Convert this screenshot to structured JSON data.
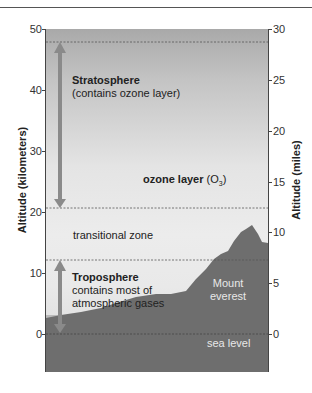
{
  "diagram": {
    "left_axis": {
      "label": "Altitude (kilometers)",
      "ticks": [
        "50",
        "40",
        "30",
        "20",
        "10",
        "0"
      ]
    },
    "right_axis": {
      "label": "Altitude (miles)",
      "ticks": [
        "30",
        "25",
        "20",
        "15",
        "10",
        "5",
        "0"
      ]
    },
    "layers": [
      {
        "name": "Stratosphere",
        "description": "(contains ozone layer)"
      },
      {
        "name": "Troposphere",
        "description_line1": "contains most of",
        "description_line2": "atmospheric gases"
      }
    ],
    "labels": {
      "ozone": "ozone layer",
      "ozone_formula_main": "(O",
      "ozone_formula_sub": "3",
      "ozone_formula_close": ")",
      "transitional": "transitional zone",
      "mountain_line1": "Mount",
      "mountain_line2": "everest",
      "sea_level": "sea level"
    },
    "boundaries_km": [
      48,
      20.5,
      12,
      0
    ],
    "colors": {
      "arrow": "#8a8a8a",
      "terrain": "#6e6e6e",
      "sea": "#b9b9b9",
      "sky_top": "#a9a9a9",
      "sky_mid": "#ececec"
    }
  }
}
